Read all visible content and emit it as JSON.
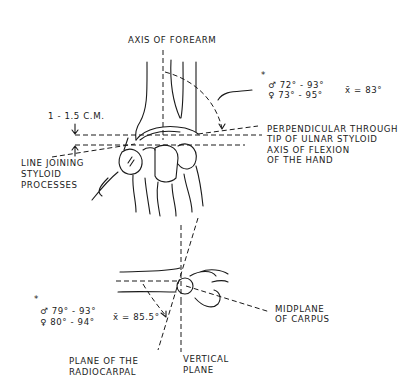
{
  "figure": {
    "top_view": {
      "axis_label": "AXIS OF FOREARM",
      "distance_label": "1 - 1.5 C.M.",
      "left_label": [
        "LINE JOINING",
        "STYLOID",
        "PROCESSES"
      ],
      "right_label": [
        "PERPENDICULAR THROUGH",
        "TIP OF ULNAR STYLOID",
        "AXIS OF FLEXION",
        "OF THE HAND"
      ],
      "angle_note": {
        "asterisk": "*",
        "male": "♂ 72° - 93°",
        "female": "♀ 73° - 95°",
        "mean": "x̄ = 83°"
      }
    },
    "side_view": {
      "angle_note": {
        "asterisk": "*",
        "male": "♂ 79° - 93°",
        "female": "♀ 80° - 94°",
        "mean": "x̄ = 85.5°"
      },
      "right_label": [
        "MIDPLANE",
        "OF CARPUS"
      ],
      "bottom_left_label": [
        "PLANE OF THE",
        "RADIOCARPAL"
      ],
      "bottom_right_label": [
        "VERTICAL",
        "PLANE"
      ]
    }
  }
}
